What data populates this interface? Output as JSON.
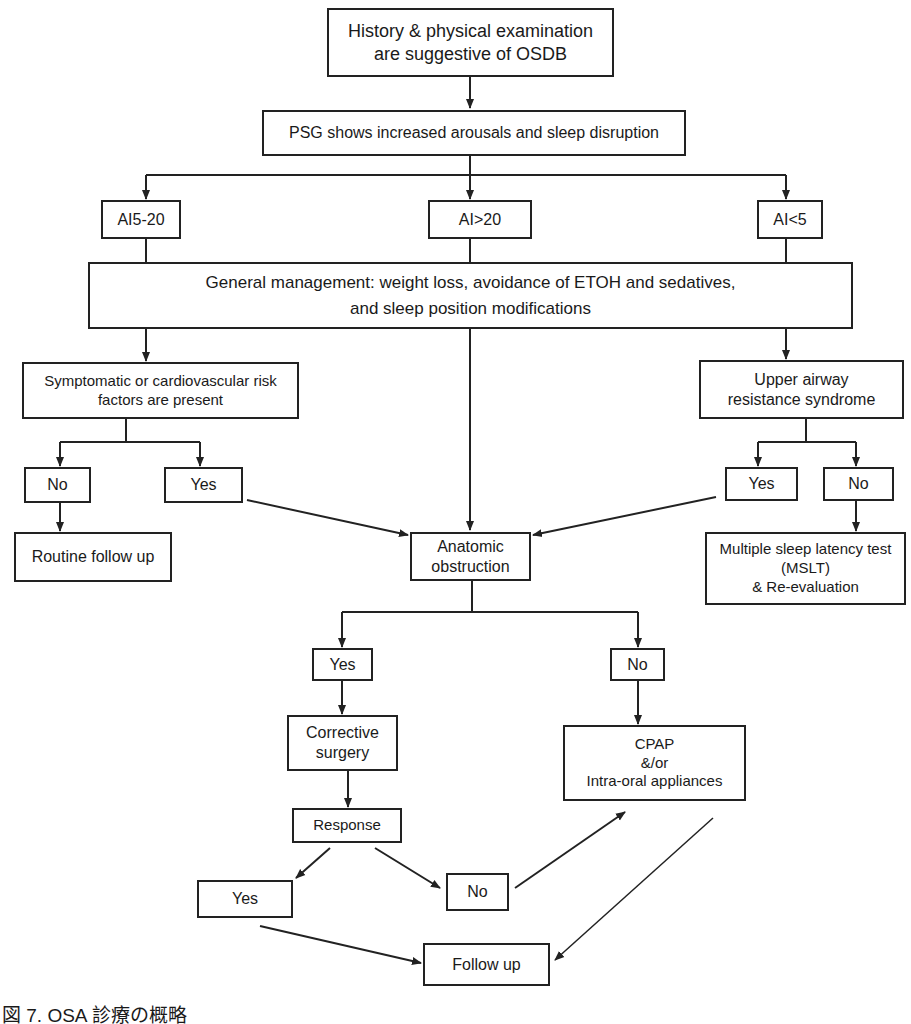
{
  "nodes": {
    "history": "History & physical examination\nare suggestive of OSDB",
    "psg": "PSG shows increased arousals and sleep disruption",
    "ai_5_20": "AI5-20",
    "ai_gt_20": "AI>20",
    "ai_lt_5": "AI<5",
    "general": "General management: weight loss, avoidance of ETOH and sedatives,\nand sleep position modifications",
    "symptomatic": "Symptomatic or cardiovascular risk\nfactors are present",
    "uars": "Upper airway\nresistance syndrome",
    "sym_no": "No",
    "sym_yes": "Yes",
    "uars_yes": "Yes",
    "uars_no": "No",
    "routine": "Routine follow up",
    "anatomic": "Anatomic\nobstruction",
    "mslt": "Multiple sleep latency test\n(MSLT)\n& Re-evaluation",
    "anat_yes": "Yes",
    "anat_no": "No",
    "corrective": "Corrective\nsurgery",
    "cpap": "CPAP\n&/or\nIntra-oral appliances",
    "response": "Response",
    "resp_yes": "Yes",
    "resp_no": "No",
    "followup": "Follow up"
  },
  "caption": "図 7. OSA 診療の概略"
}
